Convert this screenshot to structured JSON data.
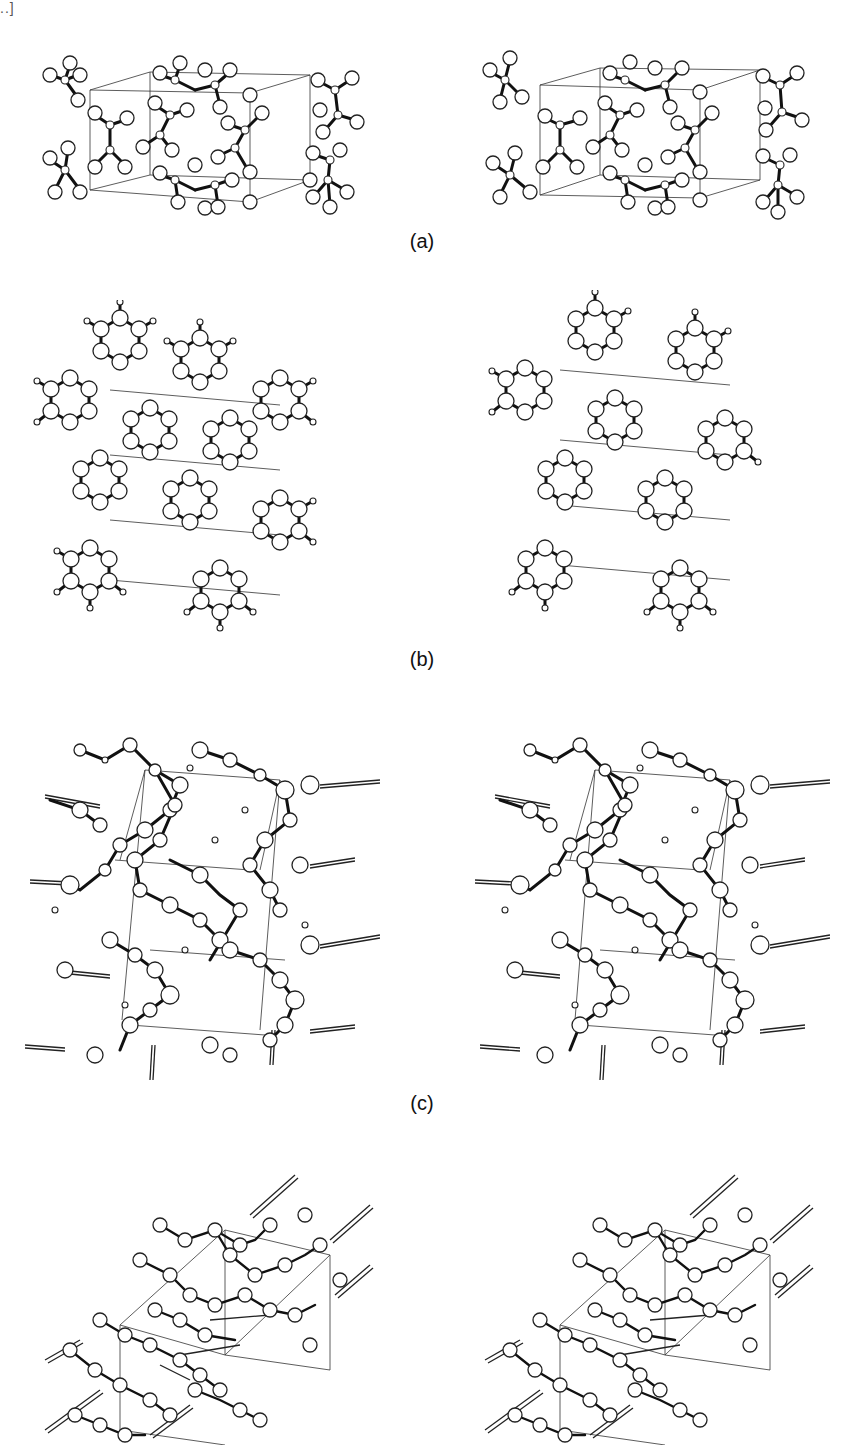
{
  "page": {
    "corner_mark": "..]",
    "figure": {
      "type": "stereo-pair crystal structure drawings",
      "panels": [
        {
          "id": "a",
          "label": "(a)",
          "description": "Unit cell packing of tetrahedral molecules (ball-and-stick), stereo pair",
          "views": [
            "left-eye",
            "right-eye"
          ]
        },
        {
          "id": "b",
          "label": "(b)",
          "description": "Layered hexagonal ring packing with hydrogens, unit cell outlined, stereo pair",
          "views": [
            "left-eye",
            "right-eye"
          ]
        },
        {
          "id": "c",
          "label": "(c)",
          "description": "Hydrogen-bonded chain network with unit cell outline, stereo pair",
          "views": [
            "left-eye",
            "right-eye"
          ]
        },
        {
          "id": "d",
          "label": "",
          "description": "Oblique view of hydrogen-bonded layered network, stereo pair (label not visible)",
          "views": [
            "left-eye",
            "right-eye"
          ]
        }
      ]
    },
    "colors": {
      "background": "#ffffff",
      "ink": "#111111"
    }
  }
}
